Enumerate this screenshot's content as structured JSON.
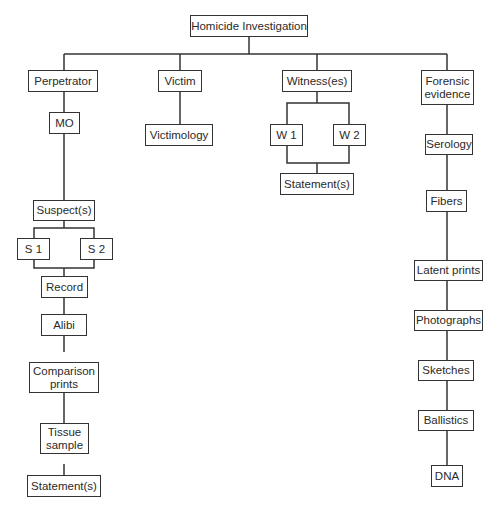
{
  "diagram": {
    "root": "Homicide Investigation",
    "perpetrator": {
      "label": "Perpetrator",
      "mo": "MO",
      "suspects": "Suspect(s)",
      "s1": "S 1",
      "s2": "S 2",
      "record": "Record",
      "alibi": "Alibi",
      "comparison_prints": "Comparison prints",
      "tissue_sample": "Tissue sample",
      "statements": "Statement(s)"
    },
    "victim": {
      "label": "Victim",
      "victimology": "Victimology"
    },
    "witnesses": {
      "label": "Witness(es)",
      "w1": "W 1",
      "w2": "W 2",
      "statements": "Statement(s)"
    },
    "forensic": {
      "label": "Forensic evidence",
      "items": [
        "Serology",
        "Fibers",
        "Latent prints",
        "Photographs",
        "Sketches",
        "Ballistics",
        "DNA"
      ]
    }
  }
}
